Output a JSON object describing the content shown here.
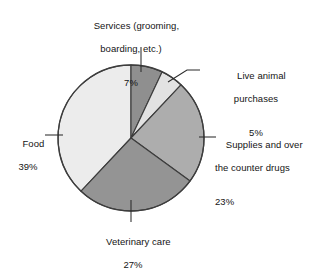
{
  "chart_data": {
    "type": "pie",
    "title": "",
    "subtitle": "",
    "xlabel": "",
    "ylabel": "",
    "legend_position": "none",
    "grid": false,
    "value_unit": "percent",
    "total": 101,
    "categories": [
      "Services (grooming, boarding, etc.)",
      "Live animal purchases",
      "Supplies and over the counter drugs",
      "Veterinary care",
      "Food"
    ],
    "values": [
      7,
      5,
      23,
      27,
      39
    ],
    "slices": [
      {
        "name": "services",
        "label_line1": "Services (grooming,",
        "label_line2": "boarding, etc.)",
        "percent_text": "7%",
        "value": 7,
        "color": "#8f8f8f",
        "start_angle": 0,
        "end_angle": 25.2
      },
      {
        "name": "live-animal",
        "label_line1": "Live animal",
        "label_line2": "purchases",
        "percent_text": "5%",
        "value": 5,
        "color": "#e2e2e2",
        "start_angle": 25.2,
        "end_angle": 43.2
      },
      {
        "name": "supplies",
        "label_line1": "Supplies and over",
        "label_line2": "the counter drugs",
        "percent_text": "23%",
        "value": 23,
        "color": "#adadad",
        "start_angle": 43.2,
        "end_angle": 126.0
      },
      {
        "name": "veterinary-care",
        "label_line1": "Veterinary care",
        "label_line2": "",
        "percent_text": "27%",
        "value": 27,
        "color": "#949494",
        "start_angle": 126.0,
        "end_angle": 223.2
      },
      {
        "name": "food",
        "label_line1": "Food",
        "label_line2": "",
        "percent_text": "39%",
        "value": 39,
        "color": "#ececec",
        "start_angle": 223.2,
        "end_angle": 360.0
      }
    ],
    "colors": {
      "services": "#8f8f8f",
      "live_animal": "#e2e2e2",
      "supplies": "#adadad",
      "veterinary_care": "#949494",
      "food": "#ececec",
      "outline": "#3d3d3d",
      "background": "#ffffff",
      "text": "#141414"
    },
    "geometry": {
      "center_x": 131,
      "center_y": 138,
      "radius": 73
    }
  }
}
